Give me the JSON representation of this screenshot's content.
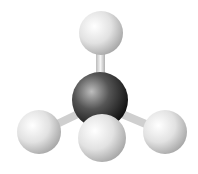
{
  "image": {
    "subject": "methane molecule ball-and-stick model",
    "atoms": [
      {
        "name": "hydrogen-top",
        "element": "H",
        "cx": 101,
        "cy": 33,
        "r": 22
      },
      {
        "name": "carbon-center",
        "element": "C",
        "cx": 100,
        "cy": 100,
        "r": 28
      },
      {
        "name": "hydrogen-left",
        "element": "H",
        "cx": 39,
        "cy": 132,
        "r": 22
      },
      {
        "name": "hydrogen-right",
        "element": "H",
        "cx": 165,
        "cy": 132,
        "r": 22
      },
      {
        "name": "hydrogen-front",
        "element": "H",
        "cx": 102,
        "cy": 138,
        "r": 24
      }
    ],
    "colors": {
      "background": "#ffffff",
      "hydrogen": "#e6e6e6",
      "carbon": "#3a3a3a",
      "bond": "#d8d8d8"
    }
  }
}
